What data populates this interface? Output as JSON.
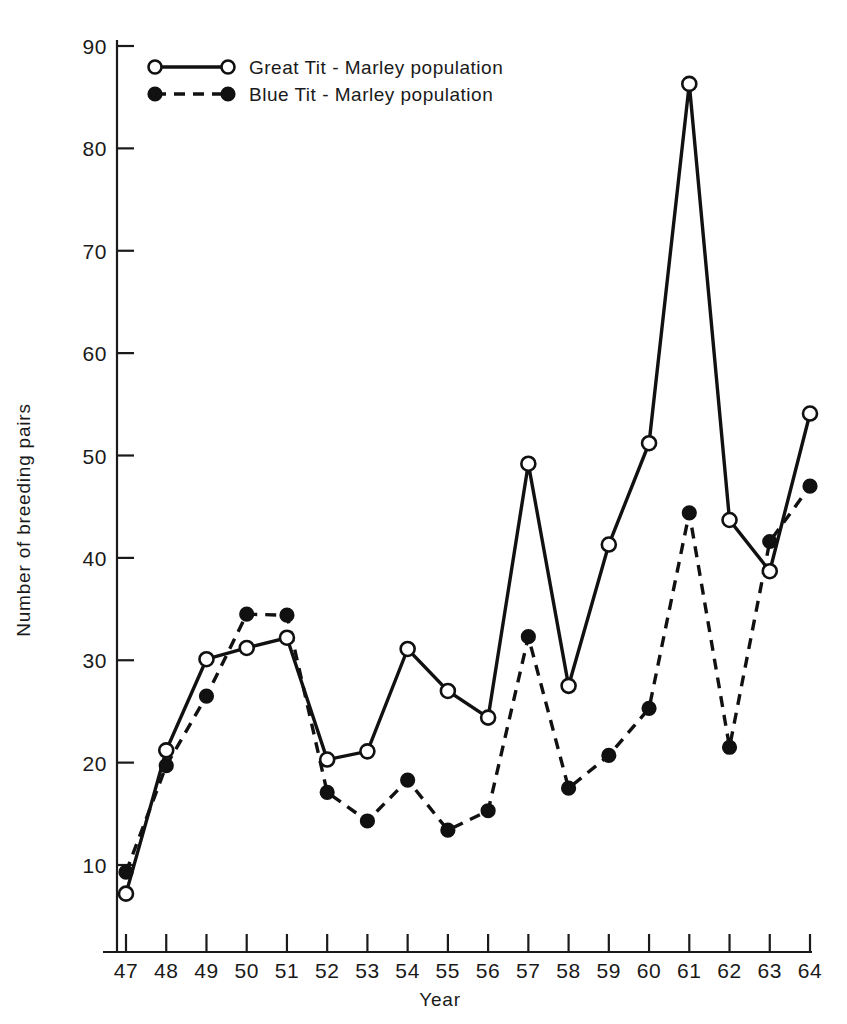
{
  "chart_data": {
    "type": "line",
    "title": "",
    "xlabel": "Year",
    "ylabel": "Number of breeding pairs",
    "categories": [
      "47",
      "48",
      "49",
      "50",
      "51",
      "52",
      "53",
      "54",
      "55",
      "56",
      "57",
      "58",
      "59",
      "60",
      "61",
      "62",
      "63",
      "64"
    ],
    "x": [
      47,
      48,
      49,
      50,
      51,
      52,
      53,
      54,
      55,
      56,
      57,
      58,
      59,
      60,
      61,
      62,
      63,
      64
    ],
    "xlim": [
      46.4,
      64.6
    ],
    "ylim": [
      0,
      90
    ],
    "ytick_values": [
      10,
      20,
      30,
      40,
      50,
      60,
      70,
      80,
      90
    ],
    "ytick_labels": [
      "10",
      "20",
      "30",
      "40",
      "50",
      "60",
      "70",
      "80",
      "90"
    ],
    "xtick_labels": [
      "47",
      "48",
      "49",
      "50",
      "51",
      "52",
      "53",
      "54",
      "55",
      "56",
      "57",
      "58",
      "59",
      "60",
      "61",
      "62",
      "63",
      "64"
    ],
    "grid": false,
    "legend_position": "top-left",
    "series": [
      {
        "name": "Great Tit - Marley population",
        "marker": "open-circle",
        "line_style": "solid",
        "color": "#111111",
        "values": [
          7.2,
          21.2,
          30.1,
          31.2,
          32.2,
          20.3,
          21.1,
          31.1,
          27.0,
          24.4,
          49.2,
          27.5,
          41.3,
          51.2,
          86.3,
          43.7,
          38.7,
          54.1
        ]
      },
      {
        "name": "Blue Tit - Marley population",
        "marker": "filled-circle",
        "line_style": "dashed",
        "color": "#111111",
        "values": [
          9.3,
          19.7,
          26.5,
          34.5,
          34.4,
          17.1,
          14.3,
          18.3,
          13.4,
          15.3,
          32.3,
          17.5,
          20.7,
          25.3,
          44.4,
          21.5,
          41.6,
          47.0
        ]
      }
    ]
  },
  "legend": {
    "entries": [
      {
        "label": "Great Tit - Marley population",
        "marker": "open-circle",
        "line_style": "solid"
      },
      {
        "label": "Blue Tit - Marley population",
        "marker": "filled-circle",
        "line_style": "dashed"
      }
    ]
  },
  "axes": {
    "y_title": "Number of breeding pairs",
    "x_title": "Year"
  }
}
